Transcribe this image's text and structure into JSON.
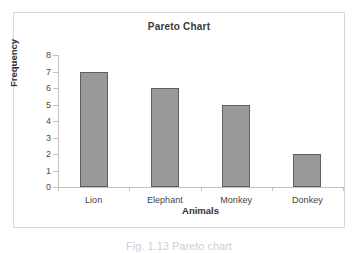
{
  "figure": {
    "caption": "Fig. 1.13 Pareto chart"
  },
  "chart_data": {
    "type": "bar",
    "title": "Pareto Chart",
    "xlabel": "Animals",
    "ylabel": "Frequency",
    "categories": [
      "Lion",
      "Elephant",
      "Monkey",
      "Donkey"
    ],
    "values": [
      7,
      6,
      5,
      2
    ],
    "ylim": [
      0,
      8
    ],
    "yticks": [
      0,
      1,
      2,
      3,
      4,
      5,
      6,
      7,
      8
    ],
    "ytick_labels": [
      "0",
      "1",
      "2",
      "3",
      "4",
      "5",
      "6",
      "7",
      "8"
    ],
    "grid": false,
    "legend": false,
    "colors": {
      "bar_fill": "#999999",
      "bar_border": "#5f5f5f",
      "axis": "#c2c2c2",
      "frame": "#d8d8d8",
      "text": "#333333"
    }
  }
}
